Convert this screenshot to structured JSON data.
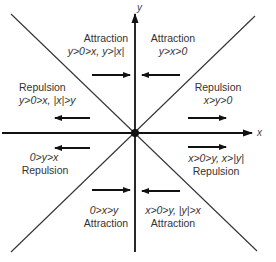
{
  "axes": {
    "x_label": "x",
    "y_label": "y"
  },
  "colors": {
    "line": "#333333",
    "text": "#333333",
    "arrow": "#111111"
  },
  "regions": [
    {
      "id": "top-left-upper",
      "type_label": "Attraction",
      "condition": "y>0>x, y>|x|",
      "arrow": "right"
    },
    {
      "id": "top-left-lower",
      "type_label": "Repulsion",
      "condition": "y>0>x, |x|>y",
      "arrow": "left"
    },
    {
      "id": "top-right-upper",
      "type_label": "Attraction",
      "condition": "y>x>0",
      "arrow": "left"
    },
    {
      "id": "top-right-lower",
      "type_label": "Repulsion",
      "condition": "x>y>0",
      "arrow": "right"
    },
    {
      "id": "bottom-left-upper",
      "type_label": "Repulsion",
      "condition": "0>y>x",
      "arrow": "left"
    },
    {
      "id": "bottom-left-lower",
      "type_label": "Attraction",
      "condition": "0>x>y",
      "arrow": "right"
    },
    {
      "id": "bottom-right-upper",
      "type_label": "Repulsion",
      "condition": "x>0>y, x>|y|",
      "arrow": "right"
    },
    {
      "id": "bottom-right-lower",
      "type_label": "Attraction",
      "condition": "x>0>y, |y|>x",
      "arrow": "left"
    }
  ]
}
